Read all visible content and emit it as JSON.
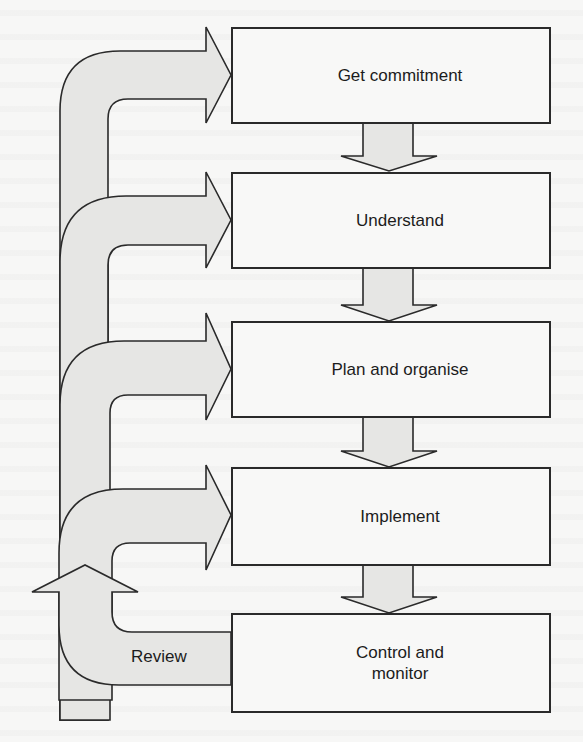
{
  "diagram": {
    "type": "process-flow",
    "steps": [
      {
        "id": "get-commitment",
        "label": "Get commitment"
      },
      {
        "id": "understand",
        "label": "Understand"
      },
      {
        "id": "plan-and-organise",
        "label": "Plan and organise"
      },
      {
        "id": "implement",
        "label": "Implement"
      },
      {
        "id": "control-and-monitor",
        "label": "Control and\nmonitor"
      }
    ],
    "feedback": {
      "label": "Review",
      "from": "control-and-monitor",
      "to": [
        "get-commitment",
        "understand",
        "plan-and-organise",
        "implement"
      ]
    },
    "colors": {
      "stroke": "#2a2a2a",
      "arrow_fill": "#e6e6e4",
      "box_fill": "#f8f8f7",
      "text": "#1c1c1c"
    }
  }
}
